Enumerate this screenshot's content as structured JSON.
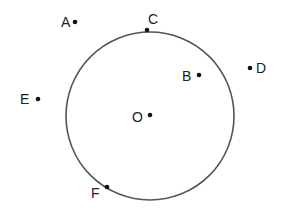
{
  "diagram": {
    "type": "geometry-circle-points",
    "circle": {
      "center_label": "O",
      "cx": 150,
      "cy": 116,
      "r": 84,
      "stroke": "#555555"
    },
    "points": [
      {
        "label": "A",
        "x": 75,
        "y": 22,
        "label_x": 61,
        "label_y": 27,
        "position": "outside"
      },
      {
        "label": "C",
        "x": 147,
        "y": 30,
        "label_x": 148,
        "label_y": 24,
        "position": "on"
      },
      {
        "label": "B",
        "x": 199,
        "y": 75,
        "label_x": 182,
        "label_y": 81,
        "position": "inside"
      },
      {
        "label": "D",
        "x": 250,
        "y": 68,
        "label_x": 256,
        "label_y": 73,
        "position": "outside"
      },
      {
        "label": "E",
        "x": 38,
        "y": 99,
        "label_x": 20,
        "label_y": 104,
        "position": "outside"
      },
      {
        "label": "O",
        "x": 150,
        "y": 115,
        "label_x": 132,
        "label_y": 122,
        "position": "center"
      },
      {
        "label": "F",
        "x": 107,
        "y": 187,
        "label_x": 91,
        "label_y": 198,
        "position": "on"
      }
    ],
    "colors": {
      "point": "#111111",
      "label": "#222222",
      "circle": "#555555"
    }
  }
}
